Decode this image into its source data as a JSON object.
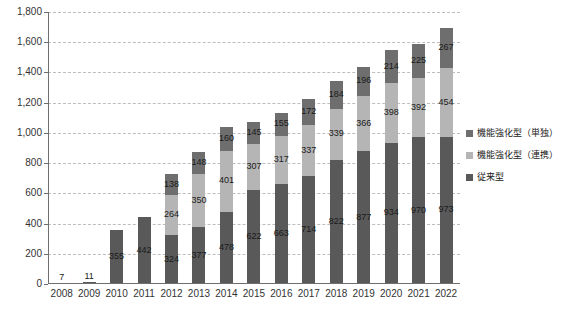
{
  "chart_data": {
    "type": "bar",
    "stacked": true,
    "title": "",
    "subtitle": "",
    "xlabel": "",
    "ylabel": "",
    "ylim": [
      0,
      1800
    ],
    "ytick_step": 200,
    "ytick_labels": [
      "1,800",
      "1,600",
      "1,400",
      "1,200",
      "1,000",
      "800",
      "600",
      "400",
      "200",
      "0"
    ],
    "ytick_values": [
      1800,
      1600,
      1400,
      1200,
      1000,
      800,
      600,
      400,
      200,
      0
    ],
    "grid": true,
    "legend_position": "right",
    "categories": [
      "2008",
      "2009",
      "2010",
      "2011",
      "2012",
      "2013",
      "2014",
      "2015",
      "2016",
      "2017",
      "2018",
      "2019",
      "2020",
      "2021",
      "2022"
    ],
    "series": [
      {
        "name": "従来型",
        "key": "bottom",
        "color": "#595959",
        "values": [
          7,
          11,
          355,
          442,
          324,
          377,
          478,
          622,
          663,
          714,
          822,
          877,
          934,
          970,
          973
        ]
      },
      {
        "name": "機能強化型（連携）",
        "key": "mid",
        "color": "#b5b5b5",
        "values": [
          0,
          0,
          0,
          0,
          264,
          350,
          401,
          307,
          317,
          337,
          339,
          366,
          398,
          392,
          454
        ]
      },
      {
        "name": "機能強化型（単独）",
        "key": "top",
        "color": "#6e6e6e",
        "values": [
          0,
          0,
          0,
          0,
          138,
          148,
          160,
          145,
          155,
          172,
          184,
          196,
          214,
          225,
          267
        ]
      }
    ],
    "bar_labels": {
      "2008": {
        "bottom": "7",
        "mid": "",
        "top": ""
      },
      "2009": {
        "bottom": "11",
        "mid": "",
        "top": ""
      },
      "2010": {
        "bottom": "355",
        "mid": "",
        "top": ""
      },
      "2011": {
        "bottom": "442",
        "mid": "",
        "top": ""
      },
      "2012": {
        "bottom": "324",
        "mid": "264",
        "top": "138"
      },
      "2013": {
        "bottom": "377",
        "mid": "350",
        "top": "148"
      },
      "2014": {
        "bottom": "478",
        "mid": "401",
        "top": "160"
      },
      "2015": {
        "bottom": "622",
        "mid": "307",
        "top": "145"
      },
      "2016": {
        "bottom": "663",
        "mid": "317",
        "top": "155"
      },
      "2017": {
        "bottom": "714",
        "mid": "337",
        "top": "172"
      },
      "2018": {
        "bottom": "822",
        "mid": "339",
        "top": "184"
      },
      "2019": {
        "bottom": "877",
        "mid": "366",
        "top": "196"
      },
      "2020": {
        "bottom": "934",
        "mid": "398",
        "top": "214"
      },
      "2021": {
        "bottom": "970",
        "mid": "392",
        "top": "225"
      },
      "2022": {
        "bottom": "973",
        "mid": "454",
        "top": "267"
      }
    }
  },
  "legend": {
    "items": [
      {
        "label": "機能強化型（単独）",
        "color": "#6e6e6e"
      },
      {
        "label": "機能強化型（連携）",
        "color": "#b5b5b5"
      },
      {
        "label": "従来型",
        "color": "#595959"
      }
    ]
  },
  "colors": {
    "grid": "#bdbdbd",
    "axis": "#6f6f6f",
    "text": "#1a1a1a",
    "background": "#ffffff"
  }
}
